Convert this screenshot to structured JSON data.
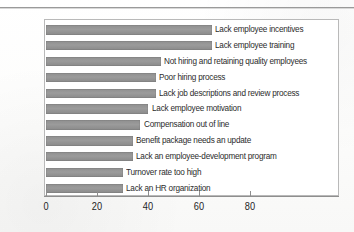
{
  "chart_data": {
    "type": "bar",
    "orientation": "horizontal",
    "title": "",
    "xlabel": "",
    "ylabel": "",
    "xlim": [
      0,
      104
    ],
    "grid": false,
    "legend": false,
    "bar_color": "#949494",
    "frame_color": "#b9b9b9",
    "axis_color": "#8e8e8e",
    "categories": [
      "Lack employee incentives",
      "Lack employee training",
      "Not hiring and retaining quality employees",
      "Poor hiring process",
      "Lack job descriptions and review process",
      "Lack employee motivation",
      "Compensation out of line",
      "Benefit package needs an update",
      "Lack an employee-development program",
      "Turnover rate too high",
      "Lack an HR organization"
    ],
    "values": [
      65,
      65,
      45,
      43,
      43,
      40,
      37,
      34,
      34,
      30,
      30
    ],
    "xticks": [
      0,
      20,
      40,
      60,
      80
    ],
    "xticklabels": [
      "0",
      "20",
      "40",
      "60",
      "80"
    ]
  }
}
